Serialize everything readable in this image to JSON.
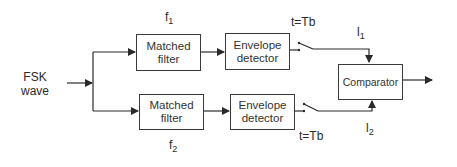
{
  "diagram": {
    "input": {
      "label_line1": "FSK",
      "label_line2": "wave"
    },
    "upper_branch": {
      "frequency_label": "f",
      "frequency_sub": "1",
      "filter": {
        "line1": "Matched",
        "line2": "filter"
      },
      "detector": {
        "line1": "Envelope",
        "line2": "detector"
      },
      "sampling_label": "t=Tb",
      "output_label": "l",
      "output_sub": "1"
    },
    "lower_branch": {
      "frequency_label": "f",
      "frequency_sub": "2",
      "filter": {
        "line1": "Matched",
        "line2": "filter"
      },
      "detector": {
        "line1": "Envelope",
        "line2": "detector"
      },
      "sampling_label": "t=Tb",
      "output_label": "l",
      "output_sub": "2"
    },
    "comparator": {
      "label": "Comparator"
    },
    "colors": {
      "line": "#2a2a2a",
      "background": "#ffffff"
    }
  }
}
